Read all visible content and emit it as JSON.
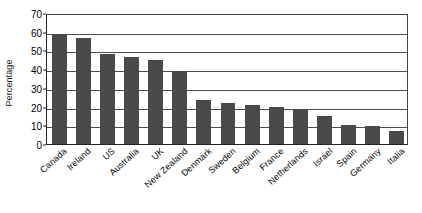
{
  "chart_data": {
    "type": "bar",
    "title": "",
    "xlabel": "",
    "ylabel": "Percentage",
    "ylim": [
      0,
      70
    ],
    "ytick_step": 10,
    "yticks": [
      0,
      10,
      20,
      30,
      40,
      50,
      60,
      70
    ],
    "grid": true,
    "legend": "none",
    "bar_color": "#4a4a4a",
    "categories": [
      "Canada",
      "Ireland",
      "US",
      "Australia",
      "UK",
      "New Zealand",
      "Denmark",
      "Sweden",
      "Belgium",
      "France",
      "Netherlands",
      "Israel",
      "Spain",
      "Germany",
      "Italia"
    ],
    "values": [
      59,
      56.5,
      48,
      46.5,
      45,
      39,
      23.5,
      22,
      21,
      20,
      18.5,
      15,
      10,
      9.5,
      7
    ]
  }
}
